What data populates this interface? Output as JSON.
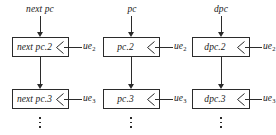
{
  "diagram": {
    "line_color": "#2b2b2b",
    "background": "#ffffff",
    "columns": [
      {
        "id": "nextpc",
        "top_label": "next pc",
        "cells": [
          {
            "label": "next pc.2",
            "enable": "ue",
            "enable_sub": "2"
          },
          {
            "label": "next pc.3",
            "enable": "ue",
            "enable_sub": "3"
          }
        ],
        "continuation": "vertical-ellipsis"
      },
      {
        "id": "pc",
        "top_label": "pc",
        "cells": [
          {
            "label": "pc.2",
            "enable": "ue",
            "enable_sub": "2"
          },
          {
            "label": "pc.3",
            "enable": "ue",
            "enable_sub": "3"
          }
        ],
        "continuation": "vertical-ellipsis"
      },
      {
        "id": "dpc",
        "top_label": "dpc",
        "cells": [
          {
            "label": "dpc.2",
            "enable": "ue",
            "enable_sub": "2"
          },
          {
            "label": "dpc.3",
            "enable": "ue",
            "enable_sub": "3"
          }
        ],
        "continuation": "vertical-ellipsis"
      }
    ]
  }
}
